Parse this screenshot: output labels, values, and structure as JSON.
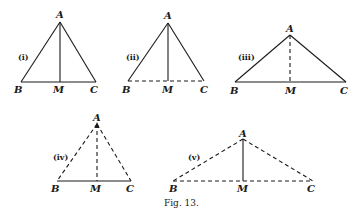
{
  "figure": {
    "caption": "Fig. 13.",
    "triangles": [
      {
        "id": "i",
        "numeral": "(i)",
        "A": [
          60,
          22
        ],
        "B": [
          21,
          82
        ],
        "C": [
          96,
          82
        ],
        "M": [
          59,
          82
        ],
        "AB": "solid",
        "AC": "solid",
        "BC": "solid",
        "AM": "solid",
        "labels": {
          "A": "A",
          "B": "B",
          "M": "M",
          "C": "C"
        }
      },
      {
        "id": "ii",
        "numeral": "(ii)",
        "A": [
          168,
          23
        ],
        "B": [
          128,
          81
        ],
        "C": [
          204,
          81
        ],
        "M": [
          168,
          81
        ],
        "AB": "solid",
        "AC": "solid",
        "BC": "dashed",
        "AM": "solid",
        "labels": {
          "A": "A",
          "B": "B",
          "M": "M",
          "C": "C"
        }
      },
      {
        "id": "iii",
        "numeral": "(iii)",
        "A": [
          290,
          35
        ],
        "B": [
          235,
          82
        ],
        "C": [
          346,
          82
        ],
        "M": [
          290,
          82
        ],
        "AB": "solid",
        "AC": "solid",
        "BC": "solid",
        "AM": "dashed",
        "labels": {
          "A": "A",
          "B": "B",
          "M": "M",
          "C": "C"
        }
      },
      {
        "id": "iv",
        "numeral": "(iv)",
        "A": [
          97,
          124
        ],
        "B": [
          57,
          181
        ],
        "C": [
          131,
          181
        ],
        "M": [
          96,
          181
        ],
        "AB": "dashed",
        "AC": "dashed",
        "BC": "solid",
        "AM": "dashed",
        "labels": {
          "A": "A",
          "B": "B",
          "M": "M",
          "C": "C"
        }
      },
      {
        "id": "v",
        "numeral": "(v)",
        "A": [
          243,
          139
        ],
        "B": [
          173,
          181
        ],
        "C": [
          313,
          181
        ],
        "M": [
          243,
          181
        ],
        "AB": "dashed",
        "AC": "dashed",
        "BC": "dashed",
        "AM": "solid",
        "labels": {
          "A": "A",
          "B": "B",
          "M": "M",
          "C": "C"
        }
      }
    ]
  }
}
